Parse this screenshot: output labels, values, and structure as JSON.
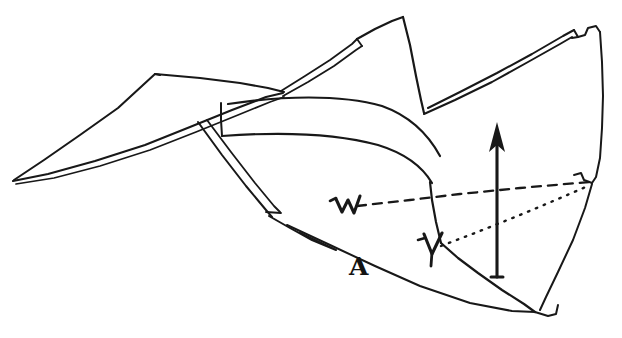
{
  "figure": {
    "kind": "hand-drawn line diagram",
    "width": 622,
    "height": 338,
    "background_color": "#ffffff",
    "ink_color": "#181818"
  },
  "labels": {
    "w": {
      "text": "W",
      "style": "handwritten",
      "x": 336,
      "y": 195
    },
    "v": {
      "text": "V",
      "style": "handwritten",
      "x": 422,
      "y": 232
    },
    "a": {
      "text": "A",
      "style": "bold serif",
      "x": 349,
      "y": 254
    }
  },
  "annotations": {
    "arrow": {
      "name": "vertical-up-arrow",
      "direction": "up",
      "x": 497,
      "y_tail": 277,
      "y_head": 124
    },
    "dashed_line": {
      "name": "dashed-reference-line",
      "from_x": 358,
      "from_y": 206,
      "to_x": 589,
      "to_y": 182
    },
    "dotted_line": {
      "name": "dotted-reference-line",
      "from_x": 441,
      "from_y": 246,
      "to_x": 588,
      "to_y": 186
    }
  },
  "geometry": {
    "left_wing_tip": {
      "x": 13,
      "y": 180
    },
    "top_left_peak": {
      "x": 155,
      "y": 74
    },
    "center_peak": {
      "x": 403,
      "y": 17
    },
    "center_valley": {
      "x": 424,
      "y": 113
    },
    "right_top_corner": {
      "x": 600,
      "y": 32
    },
    "bottom_vertex": {
      "x": 535,
      "y": 312
    }
  }
}
